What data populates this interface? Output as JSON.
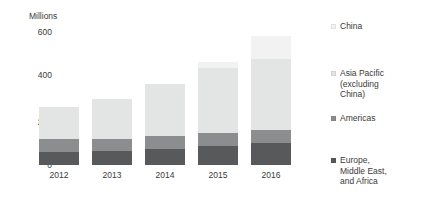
{
  "chart_data": {
    "type": "bar",
    "stacked": true,
    "title": "",
    "subtitle": "",
    "xlabel": "",
    "ylabel": "Millions",
    "categories": [
      "2012",
      "2013",
      "2014",
      "2015",
      "2016"
    ],
    "ylim": [
      0,
      600
    ],
    "yticks": [
      0,
      200,
      400,
      600
    ],
    "ytick_labels": [
      "0",
      "200",
      "400",
      "600"
    ],
    "grid": false,
    "legend_position": "right",
    "series": [
      {
        "name": "Europe, Middle East, and Africa",
        "color": "#58595b",
        "values": [
          60,
          62,
          74,
          88,
          100
        ]
      },
      {
        "name": "Americas",
        "color": "#8c8d8f",
        "values": [
          56,
          57,
          56,
          58,
          58
        ]
      },
      {
        "name": "Asia Pacific (excluding China)",
        "color": "#e3e4e4",
        "values": [
          144,
          181,
          235,
          292,
          320
        ]
      },
      {
        "name": "China",
        "color": "#f2f2f2",
        "values": [
          0,
          0,
          0,
          25,
          105
        ]
      }
    ],
    "totals": [
      260,
      300,
      365,
      463,
      583
    ]
  },
  "axis": {
    "y_title": "Millions",
    "y_ticks": [
      "600",
      "400",
      "200",
      "0"
    ],
    "x_ticks": [
      "2012",
      "2013",
      "2014",
      "2015",
      "2016"
    ]
  },
  "legend": {
    "items": [
      {
        "label_line1": "China",
        "label_line2": "",
        "label_line3": "",
        "color": "#f2f2f2"
      },
      {
        "label_line1": "Asia Pacific",
        "label_line2": "(excluding",
        "label_line3": "China)",
        "color": "#e3e4e4"
      },
      {
        "label_line1": "Americas",
        "label_line2": "",
        "label_line3": "",
        "color": "#8c8d8f"
      },
      {
        "label_line1": "Europe,",
        "label_line2": "Middle East,",
        "label_line3": "and Africa",
        "color": "#58595b"
      }
    ]
  }
}
